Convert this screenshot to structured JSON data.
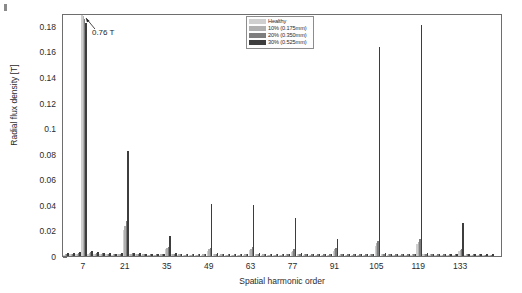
{
  "figure": {
    "corner_mark": "figure-corner-tick"
  },
  "annotation": {
    "text": "0.76 T",
    "x_harmonic": 7,
    "note": "clipped peak value at harmonic 7"
  },
  "chart_data": {
    "type": "bar",
    "title": "",
    "xlabel": "Spatial harmonic order",
    "ylabel": "Radial flux density [T]",
    "ylim": [
      0,
      0.19
    ],
    "xlim": [
      0,
      147
    ],
    "grid": false,
    "legend_position": "top-center-right",
    "yticks": [
      0,
      0.02,
      0.04,
      0.06,
      0.08,
      0.1,
      0.12,
      0.14,
      0.16,
      0.18
    ],
    "ytick_labels": [
      "0",
      "0.02",
      "0.04",
      "0.06",
      "0.08",
      "0.1",
      "0.12",
      "0.14",
      "0.16",
      "0.18"
    ],
    "xticks": [
      7,
      21,
      35,
      49,
      63,
      77,
      91,
      105,
      119,
      133
    ],
    "xtick_labels": [
      "7",
      "21",
      "35",
      "49",
      "63",
      "77",
      "91",
      "105",
      "119",
      "133"
    ],
    "categories": [
      1,
      3,
      5,
      7,
      9,
      11,
      13,
      15,
      17,
      19,
      21,
      23,
      25,
      27,
      29,
      31,
      33,
      35,
      37,
      39,
      41,
      43,
      45,
      47,
      49,
      51,
      53,
      55,
      57,
      59,
      61,
      63,
      65,
      67,
      69,
      71,
      73,
      75,
      77,
      79,
      81,
      83,
      85,
      87,
      89,
      91,
      93,
      95,
      97,
      99,
      101,
      103,
      105,
      107,
      109,
      111,
      113,
      115,
      117,
      119,
      121,
      123,
      125,
      127,
      129,
      131,
      133,
      135,
      137,
      139,
      141,
      143
    ],
    "series": [
      {
        "name": "Healthy",
        "color": "#cfcfcf",
        "values": [
          0.001,
          0.0012,
          0.0015,
          0.19,
          0.0018,
          0.0016,
          0.0014,
          0.0012,
          0.001,
          0.0012,
          0.0205,
          0.0014,
          0.0012,
          0.001,
          0.0008,
          0.0009,
          0.001,
          0.0055,
          0.0012,
          0.001,
          0.0009,
          0.0008,
          0.0008,
          0.001,
          0.0042,
          0.0012,
          0.001,
          0.0009,
          0.0008,
          0.0008,
          0.001,
          0.0046,
          0.0012,
          0.001,
          0.0009,
          0.0008,
          0.0008,
          0.001,
          0.0035,
          0.0012,
          0.001,
          0.0009,
          0.0008,
          0.0008,
          0.0009,
          0.0042,
          0.001,
          0.0009,
          0.0008,
          0.0008,
          0.0009,
          0.001,
          0.0082,
          0.0012,
          0.001,
          0.0009,
          0.0008,
          0.0008,
          0.001,
          0.0095,
          0.0012,
          0.001,
          0.0009,
          0.0008,
          0.0008,
          0.0009,
          0.0038,
          0.001,
          0.0009,
          0.0008,
          0.0007,
          0.0006
        ]
      },
      {
        "name": "10% (0.175mm)",
        "color": "#b0b0b0",
        "values": [
          0.0012,
          0.0014,
          0.0018,
          0.1875,
          0.0022,
          0.0019,
          0.0016,
          0.0014,
          0.0012,
          0.0014,
          0.0235,
          0.0016,
          0.0014,
          0.0012,
          0.001,
          0.0011,
          0.0012,
          0.0062,
          0.0014,
          0.0012,
          0.001,
          0.001,
          0.001,
          0.0012,
          0.0052,
          0.0014,
          0.0012,
          0.001,
          0.001,
          0.001,
          0.0012,
          0.0056,
          0.0014,
          0.0012,
          0.001,
          0.001,
          0.001,
          0.0012,
          0.0042,
          0.0014,
          0.0012,
          0.001,
          0.001,
          0.001,
          0.0011,
          0.0052,
          0.0012,
          0.001,
          0.001,
          0.001,
          0.0011,
          0.0012,
          0.0098,
          0.0014,
          0.0012,
          0.001,
          0.001,
          0.001,
          0.0012,
          0.0112,
          0.0014,
          0.0012,
          0.001,
          0.001,
          0.001,
          0.0011,
          0.0046,
          0.0012,
          0.001,
          0.001,
          0.0009,
          0.0008
        ]
      },
      {
        "name": "20% (0.350mm)",
        "color": "#7d7d7d",
        "values": [
          0.0015,
          0.0018,
          0.0022,
          0.185,
          0.0028,
          0.0024,
          0.002,
          0.0018,
          0.0015,
          0.0018,
          0.0275,
          0.002,
          0.0018,
          0.0015,
          0.0012,
          0.0013,
          0.0015,
          0.0072,
          0.0018,
          0.0015,
          0.0012,
          0.0012,
          0.0012,
          0.0015,
          0.0065,
          0.0018,
          0.0015,
          0.0012,
          0.0012,
          0.0012,
          0.0015,
          0.0068,
          0.0018,
          0.0015,
          0.0012,
          0.0012,
          0.0012,
          0.0015,
          0.0052,
          0.0018,
          0.0015,
          0.0012,
          0.0012,
          0.0012,
          0.0013,
          0.0065,
          0.0015,
          0.0012,
          0.0012,
          0.0012,
          0.0013,
          0.0015,
          0.0118,
          0.0018,
          0.0015,
          0.0012,
          0.0012,
          0.0012,
          0.0015,
          0.0135,
          0.0018,
          0.0015,
          0.0012,
          0.0012,
          0.0012,
          0.0013,
          0.0056,
          0.0015,
          0.0012,
          0.0012,
          0.0011,
          0.001
        ]
      },
      {
        "name": "30% (0.525mm)",
        "color": "#3d3d3d",
        "values": [
          0.002,
          0.0024,
          0.0028,
          0.1825,
          0.0036,
          0.003,
          0.0026,
          0.0022,
          0.0018,
          0.0022,
          0.0825,
          0.0026,
          0.0022,
          0.0018,
          0.0015,
          0.0016,
          0.0018,
          0.0155,
          0.0022,
          0.0018,
          0.0015,
          0.0015,
          0.0015,
          0.0018,
          0.0405,
          0.0022,
          0.0018,
          0.0015,
          0.0015,
          0.0015,
          0.0018,
          0.0398,
          0.0022,
          0.0018,
          0.0015,
          0.0015,
          0.0015,
          0.0018,
          0.0295,
          0.0022,
          0.0018,
          0.0015,
          0.0015,
          0.0015,
          0.0016,
          0.0135,
          0.0018,
          0.0015,
          0.0015,
          0.0015,
          0.0016,
          0.0018,
          0.1635,
          0.0022,
          0.0018,
          0.0015,
          0.0015,
          0.0015,
          0.0018,
          0.1805,
          0.0022,
          0.0018,
          0.0015,
          0.0015,
          0.0015,
          0.0016,
          0.0255,
          0.0018,
          0.0015,
          0.0015,
          0.0013,
          0.0012
        ]
      }
    ]
  }
}
